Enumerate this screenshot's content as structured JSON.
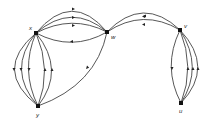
{
  "diagram": {
    "type": "directed-multigraph",
    "nodes": [
      {
        "id": "x",
        "label": "x"
      },
      {
        "id": "w",
        "label": "w"
      },
      {
        "id": "v",
        "label": "v"
      },
      {
        "id": "u",
        "label": "u"
      },
      {
        "id": "y",
        "label": "y"
      }
    ],
    "edges": [
      {
        "from": "w",
        "to": "x",
        "count": 3
      },
      {
        "from": "x",
        "to": "w",
        "count": 1
      },
      {
        "from": "x",
        "to": "y",
        "count": 3
      },
      {
        "from": "y",
        "to": "x",
        "count": 2
      },
      {
        "from": "w",
        "to": "y",
        "count": 1
      },
      {
        "from": "v",
        "to": "w",
        "count": 2
      },
      {
        "from": "v",
        "to": "u",
        "count": 1
      },
      {
        "from": "u",
        "to": "v",
        "count": 3
      }
    ]
  }
}
